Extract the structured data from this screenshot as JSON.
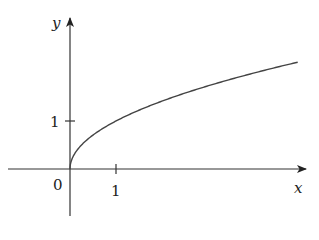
{
  "chart_data": {
    "type": "line",
    "title": "",
    "function": "y = sqrt(x)",
    "xlabel": "x",
    "ylabel": "y",
    "x_ticks": [
      1
    ],
    "y_ticks": [
      1
    ],
    "origin_label": "0",
    "xlim": [
      -1.35,
      5.2
    ],
    "ylim": [
      -1.0,
      3.1
    ],
    "grid": false,
    "legend": null,
    "series": [
      {
        "name": "y = sqrt(x)",
        "x": [
          0,
          0.05,
          0.1,
          0.25,
          0.5,
          1,
          1.5,
          2,
          2.5,
          3,
          3.5,
          4,
          4.5,
          4.95
        ],
        "y": [
          0,
          0.224,
          0.316,
          0.5,
          0.707,
          1,
          1.225,
          1.414,
          1.581,
          1.732,
          1.871,
          2,
          2.121,
          2.225
        ]
      }
    ],
    "colors": {
      "axis": "#333333",
      "curve": "#444444",
      "text": "#222222"
    }
  },
  "labels": {
    "x_axis": "x",
    "y_axis": "y",
    "origin": "0",
    "x_tick_1": "1",
    "y_tick_1": "1"
  }
}
